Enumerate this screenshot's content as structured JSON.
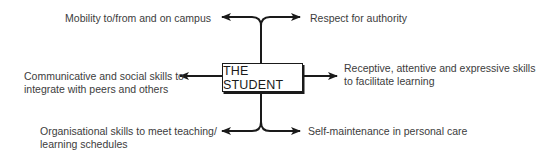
{
  "diagram": {
    "center": {
      "label": "THE STUDENT"
    },
    "branches": {
      "top_left": {
        "label": "Mobility to/from and on campus"
      },
      "top_right": {
        "label": "Respect for authority"
      },
      "middle_left": {
        "line1": "Communicative and social skills to",
        "line2": "integrate with peers and others"
      },
      "middle_right": {
        "line1": "Receptive, attentive and expressive skills",
        "line2": "to facilitate learning"
      },
      "bottom_left": {
        "line1": "Organisational skills to meet teaching/",
        "line2": "learning schedules"
      },
      "bottom_right": {
        "label": "Self-maintenance in personal care"
      }
    },
    "colors": {
      "line": "#1a1a1a",
      "text": "#3c3c3c",
      "background": "#ffffff"
    }
  }
}
